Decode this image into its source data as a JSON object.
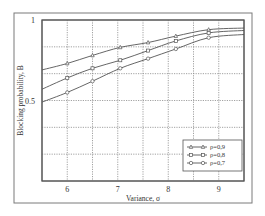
{
  "chart_data": {
    "type": "line",
    "title": "",
    "xlabel": "Variance, σ",
    "ylabel": "Blocking probability, B",
    "xlim": [
      5.5,
      9.5
    ],
    "ylim": [
      0,
      1
    ],
    "x_ticks": [
      6,
      7,
      8,
      9
    ],
    "x_tick_labels": [
      "6",
      "7",
      "8",
      "9"
    ],
    "y_ticks": [
      0.5,
      1
    ],
    "y_tick_labels": [
      "0.5",
      "1"
    ],
    "x_grid": [
      6,
      6.5,
      7,
      7.5,
      8,
      8.5,
      9
    ],
    "y_grid": [
      0.1667,
      0.3333,
      0.5,
      0.6667,
      0.8333
    ],
    "grid": true,
    "legend_position": "lower right",
    "series": [
      {
        "name": "ρ=0,9",
        "marker": "triangle",
        "x": [
          5.5,
          6.0,
          6.5,
          7.05,
          7.6,
          8.15,
          8.8,
          9.5
        ],
        "values": [
          0.69,
          0.73,
          0.78,
          0.83,
          0.86,
          0.9,
          0.94,
          0.95
        ],
        "marker_x": [
          6.0,
          6.5,
          7.05,
          7.6,
          8.15,
          8.8
        ]
      },
      {
        "name": "ρ=0,8",
        "marker": "square",
        "x": [
          5.5,
          6.0,
          6.5,
          7.05,
          7.6,
          8.15,
          8.8,
          9.5
        ],
        "values": [
          0.57,
          0.64,
          0.7,
          0.75,
          0.81,
          0.87,
          0.92,
          0.935
        ],
        "marker_x": [
          6.0,
          6.5,
          7.05,
          7.6,
          8.15,
          8.8
        ]
      },
      {
        "name": "ρ=0,7",
        "marker": "circle",
        "x": [
          5.5,
          6.0,
          6.5,
          7.05,
          7.6,
          8.15,
          8.8,
          9.5
        ],
        "values": [
          0.49,
          0.55,
          0.62,
          0.7,
          0.76,
          0.82,
          0.89,
          0.91
        ],
        "marker_x": [
          6.0,
          6.5,
          7.05,
          7.6,
          8.15,
          8.8
        ]
      }
    ]
  },
  "layout": {
    "outer": {
      "x": 14,
      "y": 13,
      "w": 238,
      "h": 190
    },
    "plot": {
      "x": 42,
      "y": 20,
      "w": 202,
      "h": 161
    },
    "legend": {
      "x": 183,
      "y": 140,
      "w": 59,
      "h": 31
    }
  }
}
